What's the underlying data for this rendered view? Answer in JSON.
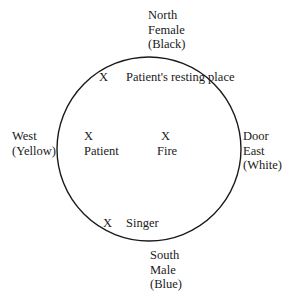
{
  "diagram": {
    "type": "ceremonial-layout",
    "circle": {
      "cx": 149,
      "cy": 149,
      "r": 92,
      "stroke": "#1a1a1a",
      "stroke_width": 1.4
    },
    "directions": {
      "north": {
        "line1": "North",
        "line2": "Female",
        "line3": "(Black)"
      },
      "south": {
        "line1": "South",
        "line2": "Male",
        "line3": "(Blue)"
      },
      "west": {
        "line1": "West",
        "line2": "(Yellow)"
      },
      "east": {
        "line1": "Door",
        "line2": "East",
        "line3": "(White)"
      }
    },
    "markers": {
      "resting_place": {
        "mark": "X",
        "label": "Patient's resting place"
      },
      "patient": {
        "mark": "X",
        "label": "Patient"
      },
      "fire": {
        "mark": "X",
        "label": "Fire"
      },
      "singer": {
        "mark": "X",
        "label": "Singer"
      }
    }
  }
}
